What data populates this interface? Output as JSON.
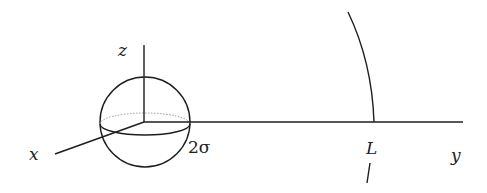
{
  "diagram": {
    "labels": {
      "x_axis": "x",
      "y_axis": "y",
      "z_axis": "z",
      "sphere_radius": "2σ",
      "distance": "L"
    },
    "colors": {
      "line": "#1e1e1e",
      "dotted": "#9a9a9a"
    }
  }
}
